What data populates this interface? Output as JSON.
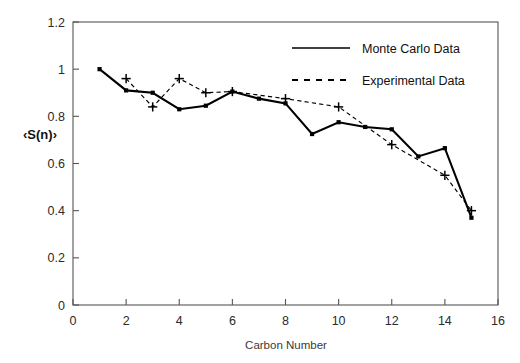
{
  "chart_data": {
    "type": "line",
    "title": "",
    "xlabel": "Carbon Number",
    "ylabel": "‹S(n)›",
    "xlim": [
      0,
      16
    ],
    "ylim": [
      0,
      1.2
    ],
    "xticks": [
      0,
      2,
      4,
      6,
      8,
      10,
      12,
      14,
      16
    ],
    "xtick_labels": [
      "0",
      "2",
      "4",
      "6",
      "8",
      "10",
      "12",
      "14",
      "16"
    ],
    "yticks": [
      0,
      0.2,
      0.4,
      0.6,
      0.8,
      1,
      1.2
    ],
    "ytick_labels": [
      "0",
      "0.2",
      "0.4",
      "0.6",
      "0.8",
      "1",
      "1.2"
    ],
    "grid": false,
    "legend_position": "top-right",
    "series": [
      {
        "name": "Monte Carlo Data",
        "style": "solid",
        "marker": "square",
        "x": [
          1,
          2,
          3,
          4,
          5,
          6,
          7,
          8,
          9,
          10,
          11,
          12,
          13,
          14,
          15
        ],
        "values": [
          1.0,
          0.91,
          0.9,
          0.83,
          0.845,
          0.905,
          0.875,
          0.855,
          0.725,
          0.775,
          0.755,
          0.745,
          0.63,
          0.665,
          0.37
        ]
      },
      {
        "name": "Experimental Data",
        "style": "dashed",
        "marker": "plus",
        "x": [
          2,
          3,
          4,
          5,
          6,
          8,
          10,
          12,
          14,
          15
        ],
        "values": [
          0.96,
          0.84,
          0.96,
          0.9,
          0.905,
          0.875,
          0.84,
          0.68,
          0.55,
          0.4
        ]
      }
    ],
    "legend": [
      {
        "label": "Monte Carlo Data",
        "style": "solid"
      },
      {
        "label": "Experimental Data",
        "style": "dashed"
      }
    ]
  },
  "figure": {
    "background_color": "#ffffff",
    "line_color": "#000000",
    "axis_color": "#555555"
  }
}
